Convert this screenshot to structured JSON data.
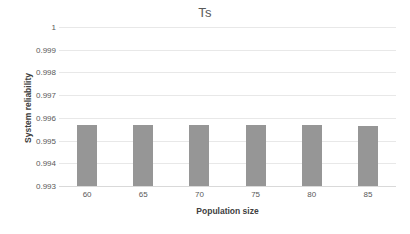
{
  "chart_data": {
    "type": "bar",
    "title": "Ts",
    "xlabel": "Population size",
    "ylabel": "System reliability",
    "categories": [
      "60",
      "65",
      "70",
      "75",
      "80",
      "85"
    ],
    "values": [
      0.9957,
      0.9957,
      0.9957,
      0.9957,
      0.99569,
      0.99566
    ],
    "ylim": [
      0.993,
      1
    ],
    "ytick_labels": [
      "1",
      "0.999",
      "0.998",
      "0.997",
      "0.996",
      "0.995",
      "0.994",
      "0.993"
    ],
    "ytick_values": [
      1,
      0.999,
      0.998,
      0.997,
      0.996,
      0.995,
      0.994,
      0.993
    ],
    "grid": "horizontal",
    "legend": "none",
    "series": [
      {
        "name": "Ts",
        "color": "#969696",
        "values": [
          0.9957,
          0.9957,
          0.9957,
          0.9957,
          0.99569,
          0.99566
        ]
      }
    ],
    "colors": {
      "bar": "#969696",
      "gridline": "#e8e8e8",
      "axis": "#d9d9d9",
      "text": "#595959",
      "background": "#ffffff"
    }
  }
}
